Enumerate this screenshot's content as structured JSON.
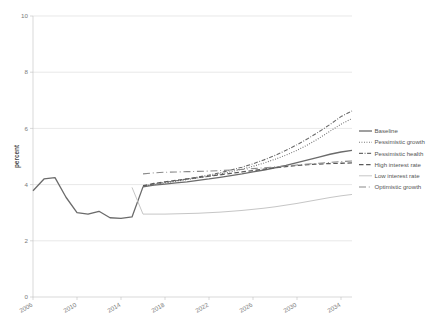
{
  "chart_data": {
    "type": "line",
    "title": "",
    "xlabel": "",
    "ylabel": "percent",
    "xlim": [
      2006,
      2035
    ],
    "ylim": [
      0,
      10
    ],
    "grid": true,
    "legend_position": "right",
    "xticks": [
      2006,
      2010,
      2014,
      2018,
      2022,
      2026,
      2030,
      2034
    ],
    "xtick_labels": [
      "2006",
      "2010",
      "2014",
      "2018",
      "2022",
      "2026",
      "2030",
      "2034"
    ],
    "yticks": [
      0,
      2,
      4,
      6,
      8,
      10
    ],
    "ytick_labels": [
      "0",
      "2",
      "4",
      "6",
      "8",
      "10"
    ],
    "x": [
      2006,
      2007,
      2008,
      2009,
      2010,
      2011,
      2012,
      2013,
      2014,
      2015,
      2016,
      2017,
      2018,
      2019,
      2020,
      2021,
      2022,
      2023,
      2024,
      2025,
      2026,
      2027,
      2028,
      2029,
      2030,
      2031,
      2032,
      2033,
      2034,
      2035
    ],
    "series": [
      {
        "name": "Baseline",
        "style": "solid",
        "color": "#6b6b6b",
        "width": 1.3,
        "values": [
          3.78,
          4.2,
          4.25,
          3.55,
          3.0,
          2.95,
          3.05,
          2.82,
          2.8,
          2.85,
          3.92,
          3.98,
          4.02,
          4.06,
          4.1,
          4.15,
          4.2,
          4.26,
          4.32,
          4.38,
          4.45,
          4.52,
          4.6,
          4.68,
          4.78,
          4.88,
          4.98,
          5.08,
          5.16,
          5.22
        ]
      },
      {
        "name": "Pessimistic growth",
        "style": "dotted",
        "color": "#6b6b6b",
        "width": 1.1,
        "values": [
          null,
          null,
          null,
          null,
          null,
          null,
          null,
          null,
          null,
          null,
          3.94,
          4.0,
          4.06,
          4.12,
          4.18,
          4.24,
          4.3,
          4.38,
          4.46,
          4.55,
          4.65,
          4.77,
          4.9,
          5.05,
          5.22,
          5.42,
          5.65,
          5.9,
          6.15,
          6.35
        ]
      },
      {
        "name": "Pessimistic health",
        "style": "dashdot",
        "color": "#6b6b6b",
        "width": 1.1,
        "values": [
          null,
          null,
          null,
          null,
          null,
          null,
          null,
          null,
          null,
          null,
          3.95,
          4.02,
          4.08,
          4.14,
          4.2,
          4.27,
          4.34,
          4.42,
          4.52,
          4.62,
          4.74,
          4.88,
          5.04,
          5.22,
          5.42,
          5.64,
          5.88,
          6.14,
          6.42,
          6.62
        ]
      },
      {
        "name": "High interest rate",
        "style": "dashed",
        "color": "#5a5a5a",
        "width": 1.3,
        "values": [
          null,
          null,
          null,
          null,
          null,
          null,
          null,
          null,
          null,
          null,
          3.96,
          4.04,
          4.1,
          4.15,
          4.2,
          4.25,
          4.3,
          4.35,
          4.4,
          4.45,
          4.5,
          4.55,
          4.6,
          4.64,
          4.68,
          4.71,
          4.73,
          4.75,
          4.76,
          4.77
        ]
      },
      {
        "name": "Low interest rate",
        "style": "solid",
        "color": "#c6c6c6",
        "width": 1.0,
        "values": [
          null,
          null,
          null,
          null,
          null,
          null,
          null,
          null,
          null,
          3.9,
          2.95,
          2.95,
          2.95,
          2.96,
          2.97,
          2.98,
          3.0,
          3.02,
          3.05,
          3.08,
          3.12,
          3.16,
          3.21,
          3.27,
          3.33,
          3.4,
          3.47,
          3.54,
          3.6,
          3.65
        ]
      },
      {
        "name": "Optimistic growth",
        "style": "longdash",
        "color": "#8a8a8a",
        "width": 1.1,
        "values": [
          null,
          null,
          null,
          null,
          null,
          null,
          null,
          null,
          null,
          null,
          4.38,
          4.42,
          4.44,
          4.45,
          4.46,
          4.47,
          4.48,
          4.5,
          4.52,
          4.54,
          4.57,
          4.6,
          4.63,
          4.66,
          4.7,
          4.73,
          4.76,
          4.79,
          4.82,
          4.84
        ]
      }
    ]
  },
  "legend": {
    "items": [
      {
        "label": "Baseline"
      },
      {
        "label": "Pessimistic growth"
      },
      {
        "label": "Pessimistic health"
      },
      {
        "label": "High interest rate"
      },
      {
        "label": "Low interest rate"
      },
      {
        "label": "Optimistic growth"
      }
    ]
  }
}
